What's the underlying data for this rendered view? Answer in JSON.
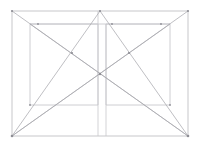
{
  "document": {
    "title": "Geometric Construction Diagram",
    "background_color": "#ffffff",
    "canvas": {
      "width": 202,
      "height": 148
    }
  },
  "palette": {
    "frame_stroke": "#b9b9bd",
    "inner_stroke": "#c2c2c6",
    "axis_stroke": "#c8c8cc",
    "diagonal_stroke": "#a9a9af",
    "node_fill": "#8e8e95",
    "background": "#ffffff"
  },
  "geometry": {
    "outer_frame": {
      "label": "outer-rectangle",
      "x": 12,
      "y": 11,
      "width": 176,
      "height": 125,
      "corners": {
        "top_left": [
          12,
          11
        ],
        "top_right": [
          188,
          11
        ],
        "bottom_right": [
          188,
          136
        ],
        "bottom_left": [
          12,
          136
        ]
      }
    },
    "left_inner_rect": {
      "label": "left-inner-rectangle",
      "x": 30,
      "y": 24,
      "width": 68,
      "height": 81,
      "corners": {
        "top_left": [
          30,
          24
        ],
        "top_right": [
          98,
          24
        ],
        "bottom_right": [
          98,
          105
        ],
        "bottom_left": [
          30,
          105
        ]
      }
    },
    "right_inner_rect": {
      "label": "right-inner-rectangle",
      "x": 106,
      "y": 24,
      "width": 64,
      "height": 81,
      "corners": {
        "top_left": [
          106,
          24
        ],
        "top_right": [
          170,
          24
        ],
        "bottom_right": [
          170,
          105
        ],
        "bottom_left": [
          106,
          105
        ]
      }
    },
    "upper_band": {
      "label": "upper-horizontal-band",
      "y": 24,
      "x_start": 30,
      "x_end": 170
    },
    "center_vertical_left": {
      "label": "center-vertical-left",
      "x": 98,
      "y_start": 11,
      "y_end": 136
    },
    "center_vertical_right": {
      "label": "center-vertical-right",
      "x": 106,
      "y_start": 24,
      "y_end": 136
    },
    "apex": {
      "label": "top-apex-node",
      "point": [
        100,
        11
      ]
    },
    "center": {
      "label": "center-node",
      "point": [
        100,
        74
      ]
    }
  },
  "diagonals": [
    {
      "id": "d1",
      "label": "top-left-to-bottom-right",
      "from": [
        12,
        11
      ],
      "to": [
        188,
        136
      ]
    },
    {
      "id": "d2",
      "label": "bottom-left-to-top-right",
      "from": [
        12,
        136
      ],
      "to": [
        188,
        11
      ]
    },
    {
      "id": "d3",
      "label": "apex-to-bottom-left",
      "from": [
        100,
        11
      ],
      "to": [
        12,
        136
      ]
    },
    {
      "id": "d4",
      "label": "apex-to-bottom-right",
      "from": [
        100,
        11
      ],
      "to": [
        188,
        136
      ]
    },
    {
      "id": "d5",
      "label": "bottom-left-to-right-upper",
      "from": [
        12,
        136
      ],
      "to": [
        170,
        24
      ]
    },
    {
      "id": "d6",
      "label": "bottom-right-to-left-upper",
      "from": [
        188,
        136
      ],
      "to": [
        30,
        24
      ]
    }
  ],
  "nodes": [
    {
      "id": "n1",
      "label": "apex-node",
      "point": [
        100,
        11
      ]
    },
    {
      "id": "n2",
      "label": "center-node",
      "point": [
        100,
        74
      ]
    },
    {
      "id": "n3",
      "label": "left-upper-intersection",
      "point": [
        72,
        53
      ]
    },
    {
      "id": "n4",
      "label": "right-upper-intersection",
      "point": [
        129,
        53
      ]
    },
    {
      "id": "n5",
      "label": "left-band-intersection",
      "point": [
        38,
        24
      ]
    },
    {
      "id": "n6",
      "label": "right-band-intersection",
      "point": [
        161,
        24
      ]
    },
    {
      "id": "n7",
      "label": "corner-top-left",
      "point": [
        12,
        11
      ]
    },
    {
      "id": "n8",
      "label": "corner-top-right",
      "point": [
        188,
        11
      ]
    },
    {
      "id": "n9",
      "label": "corner-bottom-left",
      "point": [
        12,
        136
      ]
    },
    {
      "id": "n10",
      "label": "corner-bottom-right",
      "point": [
        188,
        136
      ]
    },
    {
      "id": "n11",
      "label": "left-rect-bottom-left-node",
      "point": [
        30,
        105
      ]
    },
    {
      "id": "n12",
      "label": "right-rect-bottom-right-node",
      "point": [
        170,
        105
      ]
    },
    {
      "id": "n13",
      "label": "apex-band-node",
      "point": [
        112,
        24
      ]
    }
  ]
}
